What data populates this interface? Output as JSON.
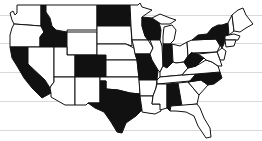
{
  "map": {
    "title": "United States map with highlighted states",
    "colors": {
      "highlighted": "#111111",
      "default": "#ffffff",
      "border": "#111111",
      "ruled_lines": "#d9d9d9"
    },
    "highlighted_states": [
      "California",
      "Idaho",
      "North Dakota",
      "Colorado",
      "Texas",
      "Wisconsin",
      "Missouri",
      "Indiana",
      "West Virginia",
      "New York",
      "Vermont",
      "North Carolina",
      "Alabama"
    ],
    "ruled_lines_y": [
      15,
      43,
      72,
      101,
      130
    ]
  }
}
